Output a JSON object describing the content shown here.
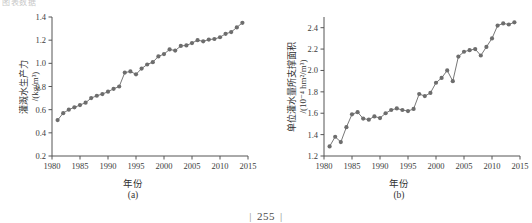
{
  "page": {
    "clipped_header_text": "图表数据",
    "page_number": "255",
    "page_number_rule_left": "|",
    "page_number_rule_right": "|"
  },
  "figures": [
    {
      "id": "a",
      "caption": "(a)",
      "xlabel": "年份",
      "ylabel_main": "灌溉水生产力",
      "ylabel_unit": "/(kg/m³)",
      "ylabel_full": "灌溉水生产力/(kg/m³)"
    },
    {
      "id": "b",
      "caption": "(b)",
      "xlabel": "年份",
      "ylabel_main": "单位灌水量所支撑面积",
      "ylabel_unit": "/(10⁻⁴ hm²/m³)",
      "ylabel_full": "单位灌水量所支撑面积/(10⁻⁴ hm²/m³)"
    }
  ],
  "style": {
    "marker_color": "#6d6d6d",
    "line_color": "#777777",
    "axis_color": "#555555",
    "text_color": "#333333",
    "background": "#ffffff"
  },
  "chart_data": [
    {
      "type": "line",
      "panel": "(a)",
      "title": "",
      "xlabel": "年份",
      "ylabel": "灌溉水生产力/(kg/m³)",
      "xlim": [
        1980,
        2015
      ],
      "ylim": [
        0.2,
        1.4
      ],
      "xticks": [
        1980,
        1985,
        1990,
        1995,
        2000,
        2005,
        2010,
        2015
      ],
      "xtick_labels": [
        "1980",
        "1985",
        "1990",
        "1995",
        "2000",
        "2005",
        "2010",
        "2015"
      ],
      "yticks": [
        0.2,
        0.4,
        0.6,
        0.8,
        1.0,
        1.2,
        1.4
      ],
      "ytick_labels": [
        "0.2",
        "0.4",
        "0.6",
        "0.8",
        "1.0",
        "1.2",
        "1.4"
      ],
      "grid": false,
      "legend": null,
      "marker": "circle",
      "x": [
        1981,
        1982,
        1983,
        1984,
        1985,
        1986,
        1987,
        1988,
        1989,
        1990,
        1991,
        1992,
        1993,
        1994,
        1995,
        1996,
        1997,
        1998,
        1999,
        2000,
        2001,
        2002,
        2003,
        2004,
        2005,
        2006,
        2007,
        2008,
        2009,
        2010,
        2011,
        2012,
        2013,
        2014
      ],
      "values": [
        0.51,
        0.57,
        0.6,
        0.62,
        0.64,
        0.66,
        0.7,
        0.72,
        0.735,
        0.755,
        0.78,
        0.8,
        0.92,
        0.93,
        0.905,
        0.955,
        0.99,
        1.01,
        1.06,
        1.08,
        1.12,
        1.11,
        1.15,
        1.155,
        1.175,
        1.2,
        1.19,
        1.205,
        1.21,
        1.225,
        1.255,
        1.27,
        1.31,
        1.35
      ]
    },
    {
      "type": "line",
      "panel": "(b)",
      "title": "",
      "xlabel": "年份",
      "ylabel": "单位灌水量所支撑面积/(10⁻⁴ hm²/m³)",
      "xlim": [
        1980,
        2015
      ],
      "ylim": [
        1.2,
        2.5
      ],
      "xticks": [
        1980,
        1985,
        1990,
        1995,
        2000,
        2005,
        2010,
        2015
      ],
      "xtick_labels": [
        "1980",
        "1985",
        "1990",
        "1995",
        "2000",
        "2005",
        "2010",
        "2015"
      ],
      "yticks": [
        1.2,
        1.4,
        1.6,
        1.8,
        2.0,
        2.2,
        2.4
      ],
      "ytick_labels": [
        "1.2",
        "1.4",
        "1.6",
        "1.8",
        "2.0",
        "2.2",
        "2.4"
      ],
      "grid": false,
      "legend": null,
      "marker": "circle",
      "x": [
        1981,
        1982,
        1983,
        1984,
        1985,
        1986,
        1987,
        1988,
        1989,
        1990,
        1991,
        1992,
        1993,
        1994,
        1995,
        1996,
        1997,
        1998,
        1999,
        2000,
        2001,
        2002,
        2003,
        2004,
        2005,
        2006,
        2007,
        2008,
        2009,
        2010,
        2011,
        2012,
        2013,
        2014
      ],
      "values": [
        1.29,
        1.38,
        1.33,
        1.47,
        1.59,
        1.61,
        1.55,
        1.54,
        1.57,
        1.555,
        1.6,
        1.63,
        1.645,
        1.63,
        1.62,
        1.64,
        1.78,
        1.76,
        1.79,
        1.885,
        1.93,
        2.0,
        1.9,
        2.13,
        2.175,
        2.19,
        2.2,
        2.14,
        2.22,
        2.3,
        2.42,
        2.44,
        2.43,
        2.45
      ]
    }
  ]
}
